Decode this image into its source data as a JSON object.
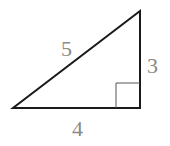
{
  "diagram": {
    "type": "right-triangle",
    "labels": {
      "hypotenuse": "5",
      "vertical_leg": "3",
      "horizontal_leg": "4"
    },
    "colors": {
      "stroke": "#1a1a1a",
      "label": "#8a8a8a",
      "right_angle_marker": "#555555"
    }
  }
}
